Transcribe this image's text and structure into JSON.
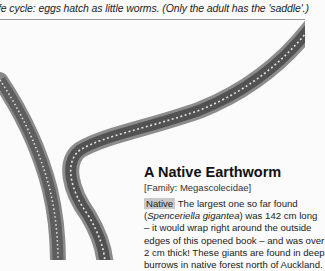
{
  "header": {
    "caption_line": "fe cycle: eggs hatch as little worms. (Only the adult has the 'saddle'.)"
  },
  "figure": {
    "worm_color": "#6e6e6e",
    "worm_dark": "#4a4a4a",
    "segment_dots": "#e0e0e0"
  },
  "caption": {
    "title": "A Native Earthworm",
    "family": "[Family: Megascolecidae]",
    "badge": "Native",
    "badge_color": "#c9c9c9",
    "lines": [
      " The largest one so far found",
      "(Spenceriella gigantea) was 142 cm long",
      "– it would wrap right around the outside",
      "edges of this opened book – and was over",
      "2 cm thick! These giants are found in deep",
      "burrows in native forest north of Auckland."
    ]
  }
}
